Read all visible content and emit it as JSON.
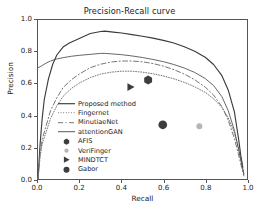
{
  "chart_data": {
    "type": "line",
    "title": "Precision-Recall curve",
    "xlabel": "Recall",
    "ylabel": "Precision",
    "xlim": [
      0.0,
      1.0
    ],
    "ylim": [
      0.0,
      1.0
    ],
    "xticks": [
      "0.0",
      "0.2",
      "0.4",
      "0.6",
      "0.8",
      "1.0"
    ],
    "yticks": [
      "0.0",
      "0.2",
      "0.4",
      "0.6",
      "0.8",
      "1.0"
    ],
    "xtick_values": [
      0.0,
      0.2,
      0.4,
      0.6,
      0.8,
      1.0
    ],
    "ytick_values": [
      0.0,
      0.2,
      0.4,
      0.6,
      0.8,
      1.0
    ],
    "grid": false,
    "legend_position": "lower left",
    "series": [
      {
        "name": "Proposed method",
        "style": "solid",
        "color": "#3b3b3b",
        "x": [
          0.0,
          0.01,
          0.02,
          0.03,
          0.05,
          0.07,
          0.09,
          0.12,
          0.15,
          0.2,
          0.25,
          0.3,
          0.32,
          0.36,
          0.4,
          0.45,
          0.5,
          0.55,
          0.6,
          0.65,
          0.7,
          0.75,
          0.8,
          0.84,
          0.88,
          0.91,
          0.94,
          0.96,
          0.97,
          0.98
        ],
        "y": [
          0.0,
          0.22,
          0.38,
          0.5,
          0.63,
          0.72,
          0.78,
          0.83,
          0.855,
          0.885,
          0.915,
          0.928,
          0.93,
          0.924,
          0.918,
          0.908,
          0.898,
          0.886,
          0.872,
          0.855,
          0.832,
          0.804,
          0.766,
          0.72,
          0.65,
          0.56,
          0.42,
          0.25,
          0.15,
          0.075
        ]
      },
      {
        "name": "Fingernet",
        "style": "dotted",
        "color": "#6e6e6e",
        "x": [
          0.0,
          0.01,
          0.02,
          0.04,
          0.06,
          0.09,
          0.12,
          0.16,
          0.2,
          0.25,
          0.3,
          0.35,
          0.4,
          0.45,
          0.5,
          0.55,
          0.6,
          0.65,
          0.7,
          0.75,
          0.8,
          0.84,
          0.88,
          0.91,
          0.94,
          0.96,
          0.975,
          0.985
        ],
        "y": [
          0.0,
          0.14,
          0.22,
          0.3,
          0.38,
          0.46,
          0.52,
          0.57,
          0.605,
          0.638,
          0.66,
          0.672,
          0.678,
          0.678,
          0.672,
          0.662,
          0.648,
          0.63,
          0.608,
          0.58,
          0.545,
          0.505,
          0.45,
          0.385,
          0.29,
          0.19,
          0.1,
          0.035
        ]
      },
      {
        "name": "MinutiaeNet",
        "style": "dashed",
        "color": "#6e6e6e",
        "x": [
          0.0,
          0.01,
          0.02,
          0.04,
          0.06,
          0.09,
          0.12,
          0.16,
          0.2,
          0.25,
          0.3,
          0.35,
          0.4,
          0.45,
          0.5,
          0.55,
          0.6,
          0.65,
          0.7,
          0.75,
          0.8,
          0.84,
          0.88,
          0.91,
          0.94,
          0.96,
          0.975,
          0.985
        ],
        "y": [
          0.0,
          0.16,
          0.25,
          0.34,
          0.43,
          0.51,
          0.575,
          0.625,
          0.662,
          0.7,
          0.722,
          0.736,
          0.742,
          0.742,
          0.737,
          0.726,
          0.71,
          0.688,
          0.66,
          0.624,
          0.578,
          0.528,
          0.455,
          0.37,
          0.255,
          0.15,
          0.07,
          0.02
        ]
      },
      {
        "name": "attentionGAN",
        "style": "thin-solid",
        "color": "#4a4a4a",
        "x": [
          0.0,
          0.01,
          0.02,
          0.04,
          0.06,
          0.09,
          0.12,
          0.16,
          0.2,
          0.25,
          0.3,
          0.32,
          0.36,
          0.4,
          0.45,
          0.5,
          0.55,
          0.6,
          0.65,
          0.7,
          0.75,
          0.8,
          0.84,
          0.88,
          0.91,
          0.94,
          0.96,
          0.975,
          0.985
        ],
        "y": [
          0.7,
          0.706,
          0.714,
          0.73,
          0.742,
          0.755,
          0.763,
          0.772,
          0.778,
          0.784,
          0.79,
          0.79,
          0.786,
          0.782,
          0.774,
          0.764,
          0.752,
          0.738,
          0.72,
          0.698,
          0.67,
          0.632,
          0.588,
          0.518,
          0.43,
          0.305,
          0.185,
          0.09,
          0.03
        ]
      }
    ],
    "points": [
      {
        "name": "AFIS",
        "x": 0.527,
        "y": 0.623,
        "marker": "hexagon",
        "color": "#3d3d3d",
        "size": 4.6
      },
      {
        "name": "VeriFinger",
        "x": 0.772,
        "y": 0.332,
        "marker": "circle",
        "color": "#b5b5b5",
        "size": 3.0
      },
      {
        "name": "MINDTCT",
        "x": 0.443,
        "y": 0.578,
        "marker": "triangle-right",
        "color": "#3d3d3d",
        "size": 4.2
      },
      {
        "name": "Gabor",
        "x": 0.597,
        "y": 0.341,
        "marker": "circle",
        "color": "#3d3d3d",
        "size": 4.4
      }
    ],
    "legend": [
      {
        "label": "Proposed method",
        "kind": "line",
        "style": "solid"
      },
      {
        "label": "Fingernet",
        "kind": "line",
        "style": "dotted"
      },
      {
        "label": "MinutiaeNet",
        "kind": "line",
        "style": "dashed"
      },
      {
        "label": "attentionGAN",
        "kind": "line",
        "style": "thin-solid"
      },
      {
        "label": "AFIS",
        "kind": "marker",
        "style": "hexagon"
      },
      {
        "label": "VeriFinger",
        "kind": "marker",
        "style": "circle-light"
      },
      {
        "label": "MINDTCT",
        "kind": "marker",
        "style": "triangle-right"
      },
      {
        "label": "Gabor",
        "kind": "marker",
        "style": "circle"
      }
    ]
  }
}
